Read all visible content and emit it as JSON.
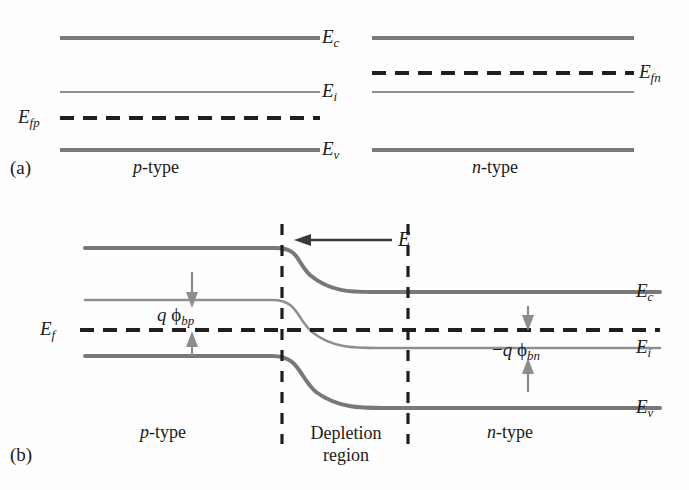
{
  "figure": {
    "type": "energy-band-diagram",
    "colors": {
      "band_major": "#787878",
      "band_minor": "#8f8f8f",
      "fermi_dashed": "#1f1f1f",
      "boundary_dashed": "#1f1f1f",
      "arrow": "#6e6e6e",
      "field_arrow": "#3a3a3a",
      "text": "#1a1a1a",
      "background": "#ffffff"
    }
  },
  "panel_a": {
    "tag": "(a)",
    "description": "Isolated p-type and n-type semiconductors before contact; flat bands, separate quasi-Fermi levels",
    "left_region_label_italic": "p",
    "left_region_label_rest": "-type",
    "right_region_label_italic": "n",
    "right_region_label_rest": "-type",
    "levels": [
      {
        "name": "conduction-band-edge",
        "symbol": "E",
        "subscript": "c",
        "style": "solid-thick",
        "y": 38,
        "side": "both"
      },
      {
        "name": "intrinsic-level",
        "symbol": "E",
        "subscript": "i",
        "style": "solid-thin",
        "y": 92,
        "side": "both"
      },
      {
        "name": "valence-band-edge",
        "symbol": "E",
        "subscript": "v",
        "style": "solid-thick",
        "y": 150,
        "side": "both"
      },
      {
        "name": "p-side-fermi-level",
        "symbol": "E",
        "subscript": "fp",
        "style": "dashed",
        "y": 118,
        "side": "left"
      },
      {
        "name": "n-side-fermi-level",
        "symbol": "E",
        "subscript": "fn",
        "style": "dashed",
        "y": 73,
        "side": "right"
      }
    ],
    "center_labels": [
      "Ec",
      "Ei",
      "Ev"
    ],
    "left_label": "Efp",
    "right_label": "Efn"
  },
  "panel_b": {
    "tag": "(b)",
    "description": "p-n junction in equilibrium; bands bend across the depletion region, single constant Fermi level",
    "left_region_label_italic": "p",
    "left_region_label_rest": "-type",
    "middle_region_line1": "Depletion",
    "middle_region_line2": "region",
    "right_region_label_italic": "n",
    "right_region_label_rest": "-type",
    "fermi_label_symbol": "E",
    "fermi_label_subscript": "f",
    "field_arrow_label": "E",
    "field_arrow_direction": "left",
    "barrier_left": {
      "name": "q-phi-bp",
      "q": "q",
      "phi": "ϕ",
      "subscript": "bp",
      "sign": ""
    },
    "barrier_right": {
      "name": "minus-q-phi-bn",
      "q": "q",
      "phi": "ϕ",
      "subscript": "bn",
      "sign": "−"
    },
    "right_labels": [
      {
        "symbol": "E",
        "subscript": "c",
        "y": 292
      },
      {
        "symbol": "E",
        "subscript": "i",
        "y": 348
      },
      {
        "symbol": "E",
        "subscript": "v",
        "y": 408
      }
    ],
    "depletion_boundaries_x": [
      282,
      408
    ],
    "band_levels_left": {
      "Ec": 248,
      "Ei": 300,
      "Ef": 330,
      "Ev": 356
    },
    "band_levels_right": {
      "Ec": 292,
      "Ei": 348,
      "Ef": 330,
      "Ev": 408
    }
  }
}
